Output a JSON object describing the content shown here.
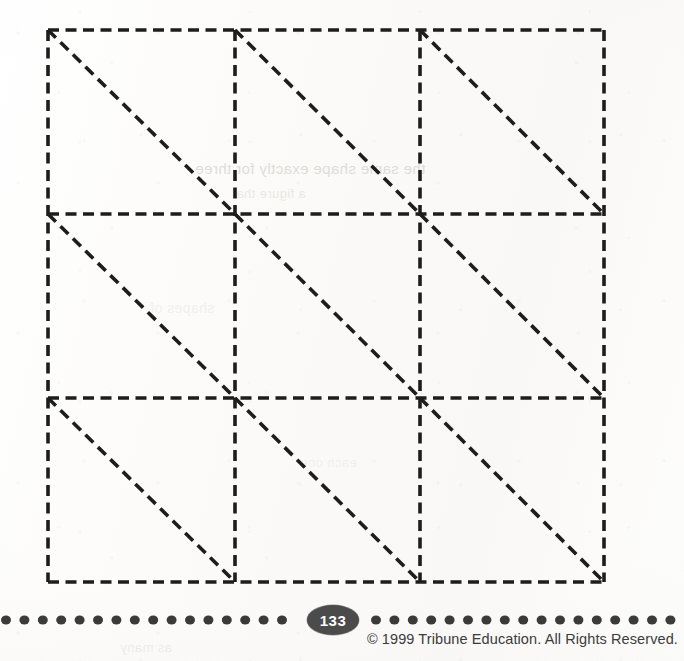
{
  "page": {
    "width": 684,
    "height": 661,
    "background_color": "#fbfbfa",
    "kind": "printed-worksheet-page"
  },
  "figure": {
    "name": "dashed-grid-with-diagonals",
    "rows": 3,
    "columns": 3,
    "cell_count": 9,
    "diagonal_direction": "top-left-to-bottom-right",
    "line_style": "dashed",
    "line_color": "#1d1d1d",
    "stroke_width": 3.6,
    "dash_length": 11,
    "dash_gap": 6.5,
    "bounds": {
      "x0": 48,
      "y0": 30,
      "x1": 604,
      "y1": 582
    },
    "column_x": [
      48,
      235,
      420,
      604
    ],
    "row_y": [
      30,
      214,
      398,
      582
    ]
  },
  "bleed_through": {
    "note": "faint mirrored text showing through from the reverse side of the sheet",
    "lines": [
      "the same shape exactly for three",
      "a figure that",
      "shapes of",
      "each one",
      "as many"
    ]
  },
  "footer": {
    "page_number": "133",
    "page_badge_color": "#4b4b4b",
    "page_number_color": "#ffffff",
    "copyright": "© 1999 Tribune Education. All Rights Reserved.",
    "copyright_color": "#3b3b3b",
    "dot_rule": {
      "dot_color": "#3a3a3a",
      "dot_diameter": 10,
      "dot_spacing": 18.4,
      "center_y": 20,
      "left_dot_count": 17,
      "right_dot_count": 18,
      "gap_start_x": 300,
      "gap_end_x": 366
    }
  }
}
